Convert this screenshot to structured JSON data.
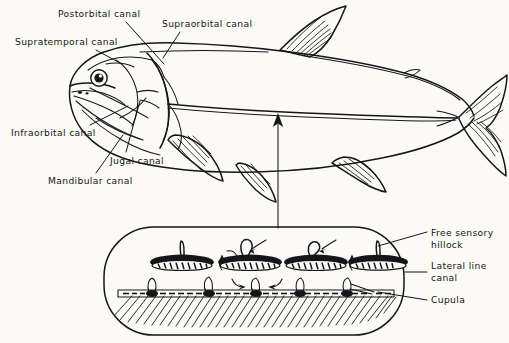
{
  "figure": {
    "background_color": "#fbfaf7",
    "ink_color": "#16161a",
    "width": 509,
    "height": 343
  },
  "head_labels": {
    "postorbital": "Postorbital canal",
    "supraorbital": "Supraorbital canal",
    "supratemporal": "Supratemporal canal",
    "infraorbital": "Infraorbital canal",
    "jugal": "Jugal canal",
    "mandibular": "Mandibular canal"
  },
  "detail_labels": {
    "free_sensory_hillock_line1": "Free sensory",
    "free_sensory_hillock_line2": "hillock",
    "lateral_line_canal_line1": "Lateral line",
    "lateral_line_canal_line2": "canal",
    "cupula": "Cupula"
  },
  "diagram_parts": {
    "fish": "fish-body-outline",
    "eye": "fish-eye",
    "dorsal_fin": "dorsal-fin",
    "caudal_fin": "caudal-fin",
    "anal_fin": "anal-fin",
    "pelvic_fin": "pelvic-fin",
    "pectoral_fin": "pectoral-fin",
    "operculum": "gill-cover",
    "lateral_line": "lateral-line-stripe",
    "magnifier_callout": "magnified-skin-section",
    "pointer_arrow": "callout-arrow"
  },
  "detail_view": {
    "hillock_count": 4,
    "neuromast_count": 5,
    "flow_arrow_count": 6
  },
  "icons": {
    "arrow_up": "arrow-up-icon",
    "flow_arrow": "flow-arrow-icon"
  }
}
